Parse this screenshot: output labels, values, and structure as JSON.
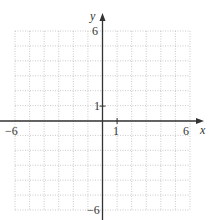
{
  "graph": {
    "x_axis_label": "x",
    "y_axis_label": "y",
    "x_min_label": "−6",
    "x_max_label": "6",
    "x_unit_label": "1",
    "y_max_label": "6",
    "y_min_label": "−6",
    "y_unit_label": "1",
    "x_range": [
      -6,
      6
    ],
    "y_range": [
      -6,
      6
    ],
    "grid_step": 1,
    "grid_style": "dotted",
    "colors": {
      "grid": "#bdbdbd",
      "axis": "#333333",
      "text": "#333333"
    }
  }
}
